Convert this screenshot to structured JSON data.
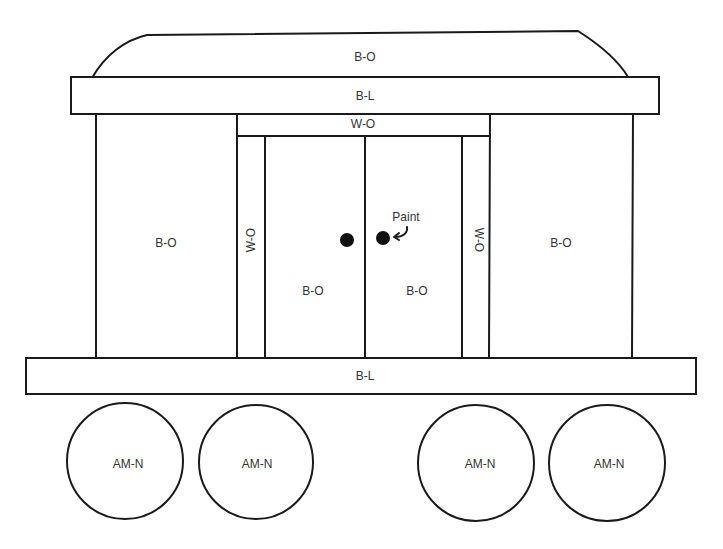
{
  "diagram": {
    "colors": {
      "line": "#1a1a1a",
      "text": "#333333",
      "background": "#ffffff",
      "knob": "#111111"
    },
    "roof": {
      "label": "B-O"
    },
    "top_bar": {
      "label": "B-L"
    },
    "door_header": {
      "label": "W-O"
    },
    "left_panel": {
      "label": "B-O"
    },
    "right_panel": {
      "label": "B-O"
    },
    "left_pillar": {
      "label": "W-O"
    },
    "right_pillar": {
      "label": "W-O"
    },
    "left_door": {
      "label": "B-O"
    },
    "right_door": {
      "label": "B-O"
    },
    "door_knobs": {
      "count": 2
    },
    "annotation": {
      "label": "Paint",
      "icon": "curved-arrow-icon"
    },
    "bottom_bar": {
      "label": "B-L"
    },
    "wheels": [
      {
        "label": "AM-N"
      },
      {
        "label": "AM-N"
      },
      {
        "label": "AM-N"
      },
      {
        "label": "AM-N"
      }
    ]
  }
}
